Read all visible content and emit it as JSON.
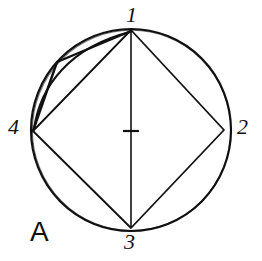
{
  "figure": {
    "panel_label": "A",
    "background_color": "#ffffff",
    "ink_color": "#111111",
    "vertex_labels": [
      {
        "id": "1",
        "text": "1",
        "position": "top"
      },
      {
        "id": "2",
        "text": "2",
        "position": "right"
      },
      {
        "id": "3",
        "text": "3",
        "position": "bottom"
      },
      {
        "id": "4",
        "text": "4",
        "position": "left"
      }
    ],
    "geometry": {
      "circle": {
        "cx": 131,
        "cy": 130,
        "rx": 100,
        "ry": 101
      },
      "vertices": {
        "v1": {
          "x": 131,
          "y": 30
        },
        "v2": {
          "x": 224,
          "y": 130
        },
        "v3": {
          "x": 131,
          "y": 228
        },
        "v4": {
          "x": 33,
          "y": 131
        }
      },
      "bend_point": {
        "x": 57,
        "y": 62
      },
      "center_tick": {
        "x": 131,
        "y": 131
      }
    },
    "strokes": {
      "circle_width": 2.2,
      "quad_width": 1.8,
      "chord_width": 0.9,
      "polyline_width": 2.4,
      "diameter_width": 1.6
    }
  }
}
